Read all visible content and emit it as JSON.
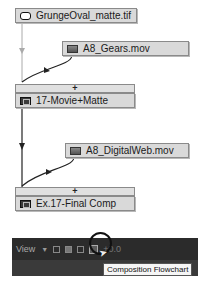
{
  "flowchart": {
    "nodes": [
      {
        "label": "GrungeOval_matte.tif",
        "icon": "still-image-icon"
      },
      {
        "label": "A8_Gears.mov",
        "icon": "movie-icon"
      },
      {
        "label": "17-Movie+Matte",
        "icon": "composition-icon"
      },
      {
        "label": "A8_DigitalWeb.mov",
        "icon": "movie-icon"
      },
      {
        "label": "Ex.17-Final Comp",
        "icon": "composition-icon"
      }
    ],
    "plus_bars": [
      "+",
      "+"
    ]
  },
  "toolbar": {
    "view_label": "View",
    "value": "+0.0"
  },
  "tooltip": {
    "text": "Composition Flowchart"
  }
}
